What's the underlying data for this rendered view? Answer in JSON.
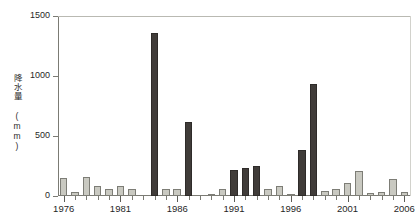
{
  "chart_data": {
    "type": "bar",
    "title": "",
    "xlabel": "",
    "ylabel": "降水量 (mm)",
    "ylim": [
      0,
      1500
    ],
    "yticks": [
      0,
      500,
      1000,
      1500
    ],
    "ytick_labels": [
      "0",
      "500",
      "1000",
      "1500"
    ],
    "grid": false,
    "legend": "none",
    "xtick_labels": [
      "1976",
      "1981",
      "1986",
      "1991",
      "1996",
      "2001",
      "2006"
    ],
    "xtick_years": [
      1976,
      1981,
      1986,
      1991,
      1996,
      2001,
      2006
    ],
    "categories": [
      "1976",
      "1977",
      "1978",
      "1979",
      "1980",
      "1981",
      "1982",
      "1983",
      "1984",
      "1985",
      "1986",
      "1987",
      "1988",
      "1989",
      "1990",
      "1991",
      "1992",
      "1993",
      "1994",
      "1995",
      "1996",
      "1997",
      "1998",
      "1999",
      "2000",
      "2001",
      "2002",
      "2003",
      "2004",
      "2005",
      "2006"
    ],
    "values": [
      150,
      30,
      155,
      80,
      55,
      80,
      60,
      0,
      1360,
      60,
      55,
      620,
      0,
      10,
      60,
      215,
      230,
      250,
      60,
      80,
      5,
      380,
      930,
      40,
      60,
      110,
      210,
      25,
      35,
      140,
      35
    ],
    "bar_colors": [
      "light",
      "light",
      "light",
      "light",
      "light",
      "light",
      "light",
      "light",
      "dark",
      "light",
      "light",
      "dark",
      "light",
      "light",
      "light",
      "dark",
      "dark",
      "dark",
      "light",
      "light",
      "light",
      "dark",
      "dark",
      "light",
      "light",
      "light",
      "light",
      "light",
      "light",
      "light",
      "light"
    ],
    "colors": {
      "light_bar": "#c9c9c1",
      "dark_bar": "#403c39",
      "axis": "#7b7b74",
      "text": "#1f1f1f",
      "background": "#ffffff"
    }
  }
}
